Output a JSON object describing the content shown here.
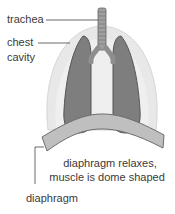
{
  "diagram": {
    "labels": {
      "trachea": "trachea",
      "chest_cavity_line1": "chest",
      "chest_cavity_line2": "cavity",
      "diaphragm": "diaphragm"
    },
    "caption": {
      "line1": "diaphragm relaxes,",
      "line2": "muscle is dome shaped"
    },
    "colors": {
      "chest_cavity": "#e6e6e6",
      "chest_cavity_edge": "#d2d2d2",
      "lung": "#7d7d7d",
      "lung_edge": "#4f4f4f",
      "trachea": "#9a9a9a",
      "diaphragm": "#bdbdbd",
      "diaphragm_edge": "#6a6a6a",
      "leader_line": "#444444",
      "text": "#3a3a3a"
    }
  }
}
